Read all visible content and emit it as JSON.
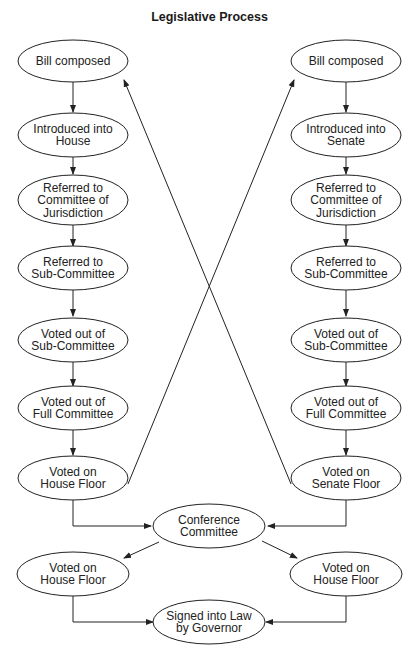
{
  "title": "Legislative Process",
  "nodes": {
    "h1": [
      "Bill composed"
    ],
    "h2": [
      "Introduced into",
      "House"
    ],
    "h3": [
      "Referred to",
      "Committee of",
      "Jurisdiction"
    ],
    "h4": [
      "Referred to",
      "Sub-Committee"
    ],
    "h5": [
      "Voted out of",
      "Sub-Committee"
    ],
    "h6": [
      "Voted out of",
      "Full Committee"
    ],
    "h7": [
      "Voted on",
      "House Floor"
    ],
    "s1": [
      "Bill composed"
    ],
    "s2": [
      "Introduced into",
      "Senate"
    ],
    "s3": [
      "Referred to",
      "Committee of",
      "Jurisdiction"
    ],
    "s4": [
      "Referred to",
      "Sub-Committee"
    ],
    "s5": [
      "Voted out of",
      "Sub-Committee"
    ],
    "s6": [
      "Voted out of",
      "Full Committee"
    ],
    "s7": [
      "Voted on",
      "Senate Floor"
    ],
    "conf": [
      "Conference",
      "Committee"
    ],
    "vl": [
      "Voted on",
      "House Floor"
    ],
    "vr": [
      "Voted on",
      "House Floor"
    ],
    "sign": [
      "Signed into Law",
      "by Governor"
    ]
  },
  "colors": {
    "line": "#222222",
    "fill": "#ffffff",
    "text": "#222222"
  }
}
